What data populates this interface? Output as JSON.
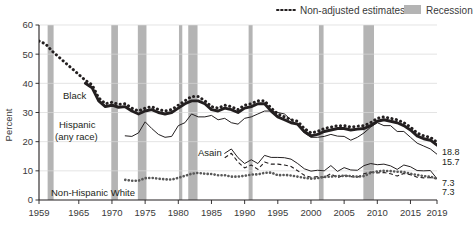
{
  "legend": {
    "items": [
      {
        "key": "non_adjusted",
        "label": "Non-adjusted estimates",
        "style": "dotted-line",
        "color": "#231f20"
      },
      {
        "key": "recession",
        "label": "Recession",
        "style": "band",
        "color": "#b4b4b4"
      }
    ]
  },
  "axes": {
    "ylabel": "Percent",
    "yticks": [
      0,
      10,
      20,
      30,
      40,
      50,
      60
    ],
    "ylim": [
      0,
      60
    ],
    "xticks": [
      1959,
      1965,
      1970,
      1975,
      1980,
      1985,
      1990,
      1995,
      2000,
      2005,
      2010,
      2015,
      2019
    ],
    "xlim": [
      1959,
      2019
    ],
    "grid": "horizontal"
  },
  "series_labels": {
    "black": "Black",
    "hispanic_line1": "Hispanic",
    "hispanic_line2": "(any race)",
    "asian": "Asain",
    "white": "Non-Hispanic White"
  },
  "end_labels": [
    {
      "value": "18.8",
      "series": "black"
    },
    {
      "value": "15.7",
      "series": "hispanic"
    },
    {
      "value": "7.3",
      "series": "asian"
    },
    {
      "value": "7.3",
      "series": "white"
    }
  ],
  "chart_data": {
    "type": "line",
    "title": "",
    "subtitle": "",
    "xlabel": "",
    "ylabel": "Percent",
    "xlim": [
      1959,
      2019
    ],
    "ylim": [
      0,
      60
    ],
    "yticks": [
      0,
      10,
      20,
      30,
      40,
      50,
      60
    ],
    "xticks": [
      1959,
      1965,
      1970,
      1975,
      1980,
      1985,
      1990,
      1995,
      2000,
      2005,
      2010,
      2015,
      2019
    ],
    "grid": "horizontal gridlines only",
    "legend_position": "top-right",
    "annotations": [
      "Black",
      "Hispanic (any race)",
      "Asain",
      "Non-Hispanic White"
    ],
    "recession_bands": [
      {
        "start": 1960.3,
        "end": 1961.2
      },
      {
        "start": 1969.9,
        "end": 1970.9
      },
      {
        "start": 1973.9,
        "end": 1975.2
      },
      {
        "start": 1980.1,
        "end": 1980.6
      },
      {
        "start": 1981.5,
        "end": 1982.9
      },
      {
        "start": 1990.6,
        "end": 1991.2
      },
      {
        "start": 2001.2,
        "end": 2001.9
      },
      {
        "start": 2007.9,
        "end": 2009.5
      }
    ],
    "series": [
      {
        "name": "Black",
        "style": "thick-solid",
        "color": "#231f20",
        "x": [
          1966,
          1967,
          1968,
          1969,
          1970,
          1971,
          1972,
          1973,
          1974,
          1975,
          1976,
          1977,
          1978,
          1979,
          1980,
          1981,
          1982,
          1983,
          1984,
          1985,
          1986,
          1987,
          1988,
          1989,
          1990,
          1991,
          1992,
          1993,
          1994,
          1995,
          1996,
          1997,
          1998,
          1999,
          2000,
          2001,
          2002,
          2003,
          2004,
          2005,
          2006,
          2007,
          2008,
          2009,
          2010,
          2011,
          2012,
          2013,
          2014,
          2015,
          2016,
          2017,
          2018,
          2019
        ],
        "values": [
          40.0,
          38.5,
          34.0,
          32.0,
          32.5,
          31.8,
          32.0,
          30.5,
          29.5,
          30.5,
          31.0,
          30.0,
          29.5,
          30.0,
          31.5,
          33.0,
          34.0,
          34.0,
          33.0,
          31.0,
          30.5,
          31.5,
          31.0,
          30.0,
          31.5,
          32.0,
          33.0,
          33.0,
          30.5,
          28.5,
          27.5,
          26.5,
          26.0,
          23.5,
          22.0,
          22.5,
          23.5,
          24.0,
          24.5,
          24.5,
          24.0,
          24.3,
          24.5,
          25.5,
          27.0,
          27.5,
          27.0,
          26.5,
          25.5,
          24.0,
          22.0,
          21.0,
          20.5,
          18.8
        ]
      },
      {
        "name": "Black (non-adjusted estimates)",
        "style": "dotted",
        "color": "#231f20",
        "x": [
          1959,
          1960,
          1961,
          1962,
          1963,
          1964,
          1965,
          1966,
          1967,
          1968,
          1969,
          1970,
          1971,
          1972,
          1973,
          1974,
          1975,
          1976,
          1977,
          1978,
          1979,
          1980,
          1981,
          1982,
          1983,
          1984,
          1985,
          1986,
          1987,
          1988,
          1989,
          1990,
          1991,
          1992,
          1993,
          1994,
          1995,
          1996,
          1997,
          1998,
          1999,
          2000,
          2001,
          2002,
          2003,
          2004,
          2005,
          2006,
          2007,
          2008,
          2009,
          2010,
          2011,
          2012,
          2013,
          2014,
          2015,
          2016,
          2017,
          2018,
          2019
        ],
        "values": [
          54.5,
          53.5,
          51.0,
          49.0,
          47.0,
          45.0,
          43.0,
          41.0,
          39.5,
          35.0,
          33.0,
          33.5,
          32.8,
          33.0,
          31.5,
          30.5,
          31.5,
          32.0,
          31.0,
          30.5,
          31.0,
          32.5,
          34.0,
          35.5,
          35.5,
          34.0,
          32.0,
          31.5,
          32.5,
          32.0,
          31.0,
          32.5,
          33.0,
          34.0,
          34.0,
          31.5,
          29.5,
          28.5,
          27.5,
          27.0,
          24.5,
          23.0,
          23.5,
          24.5,
          25.0,
          25.5,
          25.5,
          25.0,
          25.3,
          25.5,
          26.5,
          28.0,
          28.5,
          28.0,
          27.5,
          26.5,
          25.0,
          23.0,
          22.0,
          21.5,
          19.8
        ]
      },
      {
        "name": "Hispanic (any race)",
        "style": "thin-solid",
        "color": "#231f20",
        "x": [
          1972,
          1973,
          1974,
          1975,
          1976,
          1977,
          1978,
          1979,
          1980,
          1981,
          1982,
          1983,
          1984,
          1985,
          1986,
          1987,
          1988,
          1989,
          1990,
          1991,
          1992,
          1993,
          1994,
          1995,
          1996,
          1997,
          1998,
          1999,
          2000,
          2001,
          2002,
          2003,
          2004,
          2005,
          2006,
          2007,
          2008,
          2009,
          2010,
          2011,
          2012,
          2013,
          2014,
          2015,
          2016,
          2017,
          2018,
          2019
        ],
        "values": [
          22.0,
          21.8,
          23.0,
          26.8,
          24.5,
          22.5,
          21.5,
          21.8,
          25.5,
          26.5,
          29.5,
          28.5,
          28.5,
          29.0,
          27.5,
          28.0,
          26.5,
          26.0,
          28.0,
          28.5,
          29.5,
          30.5,
          30.5,
          30.0,
          29.5,
          27.5,
          25.5,
          23.0,
          21.5,
          21.5,
          21.8,
          22.5,
          21.9,
          21.8,
          20.5,
          21.5,
          23.0,
          25.0,
          26.5,
          25.5,
          25.5,
          23.5,
          23.5,
          21.5,
          19.5,
          18.5,
          17.5,
          15.7
        ]
      },
      {
        "name": "Asain",
        "style": "thin-solid-upper",
        "color": "#231f20",
        "x": [
          1987,
          1988,
          1989,
          1990,
          1991,
          1992,
          1993,
          1994,
          1995,
          1996,
          1997,
          1998,
          1999,
          2000,
          2001,
          2002,
          2003,
          2004,
          2005,
          2006,
          2007,
          2008,
          2009,
          2010,
          2011,
          2012,
          2013,
          2014,
          2015,
          2016,
          2017,
          2018,
          2019
        ],
        "values": [
          16.0,
          17.5,
          14.5,
          12.5,
          13.8,
          12.5,
          15.3,
          14.6,
          14.6,
          14.5,
          14.0,
          12.5,
          10.7,
          9.9,
          10.2,
          10.0,
          11.8,
          9.8,
          11.1,
          10.3,
          10.2,
          11.8,
          12.5,
          12.1,
          12.3,
          11.7,
          10.5,
          12.0,
          11.4,
          10.1,
          10.0,
          10.1,
          7.3
        ]
      },
      {
        "name": "Asain (non-adjusted estimates)",
        "style": "dashed",
        "color": "#231f20",
        "x": [
          1987,
          1988,
          1989,
          1990,
          1991,
          1992,
          1993,
          1994,
          1995,
          1996,
          1997,
          1998,
          1999,
          2000,
          2001,
          2002,
          2003,
          2004,
          2005,
          2006,
          2007,
          2008,
          2009,
          2010,
          2011,
          2012,
          2013,
          2014,
          2015,
          2016,
          2017,
          2018,
          2019
        ],
        "values": [
          14.5,
          16.0,
          13.0,
          11.0,
          12.0,
          10.5,
          13.0,
          12.3,
          12.3,
          12.0,
          11.5,
          10.0,
          8.5,
          7.8,
          8.0,
          7.8,
          9.0,
          7.6,
          8.5,
          8.0,
          7.8,
          9.0,
          9.6,
          9.3,
          9.4,
          9.0,
          8.2,
          9.1,
          8.7,
          7.8,
          7.6,
          7.7,
          7.3
        ]
      },
      {
        "name": "Non-Hispanic White",
        "style": "thick-dotted-gray",
        "color": "#595959",
        "x": [
          1972,
          1973,
          1974,
          1975,
          1976,
          1977,
          1978,
          1979,
          1980,
          1981,
          1982,
          1983,
          1984,
          1985,
          1986,
          1987,
          1988,
          1989,
          1990,
          1991,
          1992,
          1993,
          1994,
          1995,
          1996,
          1997,
          1998,
          1999,
          2000,
          2001,
          2002,
          2003,
          2004,
          2005,
          2006,
          2007,
          2008,
          2009,
          2010,
          2011,
          2012,
          2013,
          2014,
          2015,
          2016,
          2017,
          2018,
          2019
        ],
        "values": [
          6.9,
          6.6,
          6.6,
          7.5,
          7.6,
          7.3,
          7.1,
          7.0,
          7.6,
          8.3,
          9.0,
          9.3,
          9.0,
          8.9,
          8.5,
          8.5,
          8.0,
          8.0,
          8.3,
          8.7,
          8.8,
          9.3,
          9.4,
          8.5,
          8.6,
          8.4,
          8.0,
          7.6,
          7.3,
          7.5,
          7.9,
          8.0,
          8.2,
          8.3,
          8.2,
          8.0,
          8.2,
          9.3,
          9.8,
          10.0,
          9.9,
          9.7,
          9.6,
          9.0,
          8.6,
          8.2,
          8.0,
          7.3
        ]
      }
    ]
  }
}
